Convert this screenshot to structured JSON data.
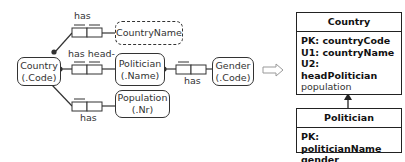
{
  "orm": {
    "entities": {
      "country": {
        "name": "Country",
        "ref": "(.Code)"
      },
      "politician": {
        "name": "Politician",
        "ref": "(.Name)"
      },
      "gender": {
        "name": "Gender",
        "ref": "(.Code)"
      },
      "population": {
        "name": "Population",
        "ref": "(.Nr)"
      },
      "country_name": {
        "name": "CountryName"
      }
    },
    "facts": {
      "country_name": {
        "reading": "has"
      },
      "head": {
        "reading": "has head-"
      },
      "population": {
        "reading": "has"
      },
      "gender": {
        "reading": "has"
      }
    }
  },
  "arrow": {
    "symbol": "⇨"
  },
  "relational": {
    "country_table": {
      "title": "Country",
      "rows": [
        {
          "text": "PK: countryCode",
          "bold": true
        },
        {
          "text": "U1: countryName",
          "bold": true
        },
        {
          "text": "U2: headPolitician",
          "bold": true
        },
        {
          "text": "population",
          "bold": false
        }
      ]
    },
    "politician_table": {
      "title": "Politician",
      "rows": [
        {
          "text": "PK: politicianName",
          "bold": true
        },
        {
          "text": "gender",
          "bold": true
        }
      ]
    }
  }
}
